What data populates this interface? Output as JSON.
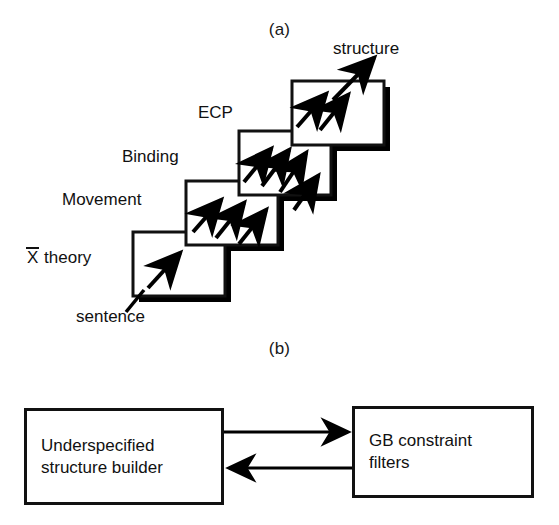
{
  "figure": {
    "panel_a_caption": "(a)",
    "panel_b_caption": "(b)"
  },
  "panel_a": {
    "input_label": "sentence",
    "output_label": "structure",
    "stages": [
      {
        "id": "xbar-theory",
        "label_prefix": "X",
        "label_suffix": " theory",
        "full_label": "X̄ theory",
        "arrow_count": 1
      },
      {
        "id": "movement",
        "label": "Movement",
        "arrow_count": 3
      },
      {
        "id": "binding",
        "label": "Binding",
        "arrow_count": 4
      },
      {
        "id": "ecp",
        "label": "ECP",
        "arrow_count": 2
      }
    ]
  },
  "panel_b": {
    "left_block": {
      "line1": "Underspecified",
      "line2": "structure builder"
    },
    "right_block": {
      "line1": "GB constraint",
      "line2": "filters"
    },
    "forward_arrow": "arrow-right",
    "return_arrow": "arrow-left"
  },
  "colors": {
    "ink": "#111111",
    "paper": "#ffffff",
    "shadow": "#000000"
  }
}
